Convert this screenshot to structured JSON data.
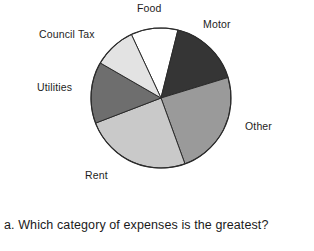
{
  "chart_data": {
    "type": "pie",
    "title": "",
    "subtitle": "",
    "xlabel": "",
    "ylabel": "",
    "legend_position": "none",
    "grid": false,
    "labels_placement": "outside-callout",
    "categories": [
      "Food",
      "Motor",
      "Other",
      "Rent",
      "Utilities",
      "Council Tax"
    ],
    "values": [
      11,
      16,
      24,
      25,
      14,
      10
    ],
    "slices": [
      {
        "label": "Food",
        "value": 11,
        "percent": 11,
        "start_angle_deg": 335,
        "end_angle_deg": 374,
        "color": "#ffffff",
        "stroke": "#2b2b2b"
      },
      {
        "label": "Motor",
        "value": 16,
        "percent": 16,
        "start_angle_deg": 14,
        "end_angle_deg": 73,
        "color": "#353535",
        "stroke": "#2b2b2b"
      },
      {
        "label": "Other",
        "value": 24,
        "percent": 24,
        "start_angle_deg": 73,
        "end_angle_deg": 160,
        "color": "#9a9a9a",
        "stroke": "#2b2b2b"
      },
      {
        "label": "Rent",
        "value": 25,
        "percent": 25,
        "start_angle_deg": 160,
        "end_angle_deg": 249,
        "color": "#c9c9c9",
        "stroke": "#2b2b2b"
      },
      {
        "label": "Utilities",
        "value": 14,
        "percent": 14,
        "start_angle_deg": 249,
        "end_angle_deg": 300,
        "color": "#6e6e6e",
        "stroke": "#2b2b2b"
      },
      {
        "label": "Council Tax",
        "value": 10,
        "percent": 10,
        "start_angle_deg": 300,
        "end_angle_deg": 335,
        "color": "#e3e3e3",
        "stroke": "#2b2b2b"
      }
    ],
    "center": {
      "x": 161,
      "y": 98
    },
    "radius": 70,
    "annotations": []
  },
  "chart_labels": {
    "food": "Food",
    "motor": "Motor",
    "council_tax": "Council Tax",
    "utilities": "Utilities",
    "other": "Other",
    "rent": "Rent"
  },
  "question": {
    "text": "a. Which category of expenses is the greatest?"
  },
  "colors": {
    "food": "#ffffff",
    "motor": "#353535",
    "other": "#9a9a9a",
    "rent": "#c9c9c9",
    "utilities": "#6e6e6e",
    "council_tax": "#e3e3e3",
    "outline": "#2b2b2b",
    "text": "#1a1a1a",
    "background": "#ffffff"
  }
}
